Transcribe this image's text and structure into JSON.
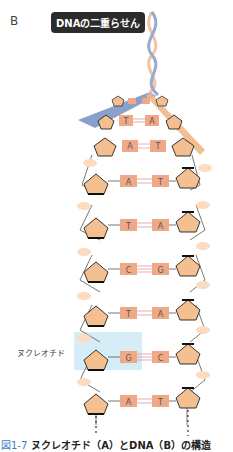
{
  "panel": {
    "label": "B"
  },
  "title": {
    "text": "DNAの二重らせん"
  },
  "nucleotide_label": "ヌクレオチド",
  "caption": {
    "figure_number": "図1-7",
    "text": "ヌクレオチド（A）とDNA（B）の構造"
  },
  "colors": {
    "sugar": "#f5c08f",
    "base": "#f0a987",
    "phosphate": "#fbdcc0",
    "strand_blue": "#7e95c8",
    "strand_orange": "#f1b788",
    "highlight": "#d6ecf7"
  },
  "base_pairs": [
    {
      "left": "A",
      "right": "T"
    },
    {
      "left": "T",
      "right": "A"
    },
    {
      "left": "C",
      "right": "G"
    },
    {
      "left": "T",
      "right": "A"
    },
    {
      "left": "G",
      "right": "C"
    },
    {
      "left": "A",
      "right": "T"
    }
  ],
  "top_pairs": [
    {
      "left": "T",
      "right": "A"
    },
    {
      "left": "A",
      "right": "T"
    }
  ]
}
